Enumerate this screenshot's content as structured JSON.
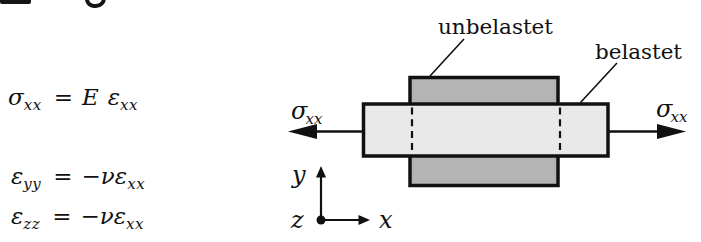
{
  "equations": {
    "hooke": {
      "lhs_main": "σ",
      "lhs_sub": "xx",
      "relation": "=",
      "rhs_factor": "E",
      "rhs_main": "ε",
      "rhs_sub": "xx"
    },
    "lateral_y": {
      "lhs_main": "ε",
      "lhs_sub": "yy",
      "relation": "=",
      "rhs_prefix": "−ν",
      "rhs_main": "ε",
      "rhs_sub": "xx"
    },
    "lateral_z": {
      "lhs_main": "ε",
      "lhs_sub": "zz",
      "relation": "=",
      "rhs_prefix": "−ν",
      "rhs_main": "ε",
      "rhs_sub": "xx"
    }
  },
  "diagram": {
    "label_unloaded": "unbelastet",
    "label_loaded": "belastet",
    "stress_left": {
      "main": "σ",
      "sub": "xx"
    },
    "stress_right": {
      "main": "σ",
      "sub": "xx"
    },
    "axis_x": "x",
    "axis_y": "y",
    "axis_z": "z",
    "colors": {
      "unloaded_fill": "#b4b4b4",
      "loaded_fill": "#e9e9e9",
      "outline": "#111111"
    }
  }
}
